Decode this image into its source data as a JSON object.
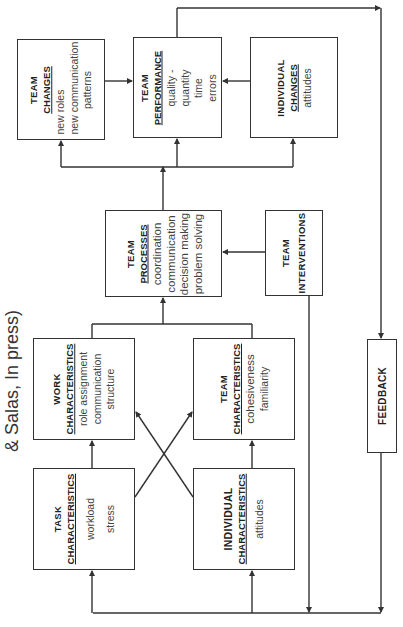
{
  "title_fragment": "& Salas, In press)",
  "boxes": {
    "team_changes": {
      "line1": "TEAM",
      "line2": "CHANGES",
      "items": [
        "new roles",
        "new communication",
        "patterns"
      ]
    },
    "team_performance": {
      "line1": "TEAM",
      "line2": "PERFORMANCE",
      "items": [
        "quality -",
        "quantity",
        "time",
        "errors"
      ]
    },
    "individual_changes": {
      "line1": "INDIVIDUAL",
      "line2": "CHANGES",
      "items": [
        "attitudes"
      ]
    },
    "team_processes": {
      "line1": "TEAM",
      "line2": "PROCESSES",
      "items": [
        "coordination",
        "communication",
        "decision making",
        "problem solving"
      ]
    },
    "team_interventions": {
      "line1": "TEAM",
      "line2": "INTERVENTIONS",
      "items": []
    },
    "work_characteristics": {
      "line1": "WORK",
      "line2": "CHARACTERISTICS",
      "items": [
        "role assignment",
        "communication",
        "structure"
      ]
    },
    "team_characteristics": {
      "line1": "TEAM",
      "line2": "CHARACTERISTICS",
      "items": [
        "cohesiveness",
        "familiarity"
      ]
    },
    "task_characteristics": {
      "line1": "TASK",
      "line2": "CHARACTERISTICS",
      "items": [
        "workload",
        "stress"
      ]
    },
    "individual_characteristics": {
      "line1": "INDIVIDUAL",
      "line2": "CHARACTERISTICS",
      "items": [
        "attitudes"
      ]
    },
    "feedback": {
      "line1": "FEEDBACK"
    }
  },
  "colors": {
    "line": "#333333",
    "text": "#222222",
    "item_text": "#444444"
  }
}
